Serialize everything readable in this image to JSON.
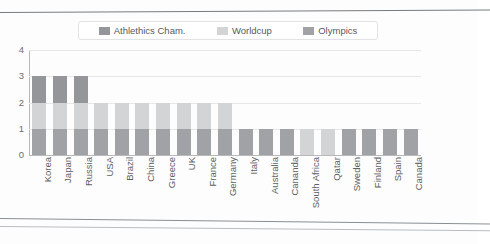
{
  "page": {
    "clipped_header_text": "",
    "background": "#fdfdfd"
  },
  "chart_data": {
    "type": "bar",
    "stacked": true,
    "title": "",
    "subtitle": "",
    "xlabel": "",
    "ylabel": "",
    "ylim": [
      0,
      4
    ],
    "yticks": [
      0,
      1,
      2,
      3,
      4
    ],
    "grid": true,
    "legend_position": "top",
    "categories": [
      "Korea",
      "Japan",
      "Russia",
      "USA",
      "Brazil",
      "China",
      "Greece",
      "UK",
      "France",
      "Germany",
      "Italy",
      "Australia",
      "Cananda",
      "South Africa",
      "Qatar",
      "Sweden",
      "Finland",
      "Spain",
      "Canada"
    ],
    "series": [
      {
        "name": "Olympics",
        "color": "#a0a2a5",
        "values": [
          1,
          1,
          1,
          1,
          1,
          1,
          1,
          1,
          1,
          1,
          1,
          1,
          1,
          0,
          0,
          1,
          1,
          1,
          1
        ]
      },
      {
        "name": "Worldcup",
        "color": "#d3d4d5",
        "values": [
          1,
          1,
          1,
          1,
          1,
          1,
          1,
          1,
          1,
          1,
          0,
          0,
          0,
          1,
          1,
          0,
          0,
          0,
          0
        ]
      },
      {
        "name": "Athlethics Cham.",
        "color": "#949699",
        "values": [
          1,
          1,
          1,
          0,
          0,
          0,
          0,
          0,
          0,
          0,
          0,
          0,
          0,
          0,
          0,
          0,
          0,
          0,
          0
        ]
      }
    ],
    "totals": [
      3,
      3,
      3,
      2,
      2,
      2,
      2,
      2,
      2,
      2,
      1,
      1,
      1,
      1,
      1,
      1,
      1,
      1,
      1
    ]
  },
  "legend": {
    "entries": [
      {
        "label": "Athlethics Cham.",
        "color": "#949699"
      },
      {
        "label": "Worldcup",
        "color": "#d3d4d5"
      },
      {
        "label": "Olympics",
        "color": "#a0a2a5"
      }
    ]
  },
  "colors": {
    "gridline": "#e6e7e8",
    "axis": "#b6b8ba",
    "tick_text": "#6d6f72",
    "label_text": "#5e6063"
  }
}
